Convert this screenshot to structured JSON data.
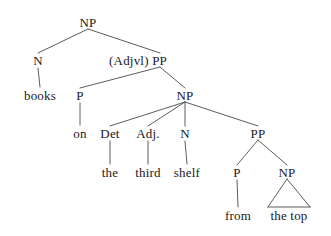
{
  "diagram": {
    "type": "syntax-tree",
    "title": "",
    "sentence": "books on the third shelf from the top",
    "background_color": "#ffffff",
    "line_color": "#4a4a4a",
    "text_color": "#1a1a1a"
  },
  "nodes": [
    {
      "id": "np-root",
      "label": "NP",
      "x": 88,
      "y": 22,
      "kind": "phrase"
    },
    {
      "id": "n-1",
      "label": "N",
      "x": 38,
      "y": 60,
      "kind": "category"
    },
    {
      "id": "pp-1",
      "label": "(Adjvl) PP",
      "x": 138,
      "y": 60,
      "kind": "phrase-optional"
    },
    {
      "id": "books",
      "label": "books",
      "x": 40,
      "y": 95,
      "kind": "terminal"
    },
    {
      "id": "p-1",
      "label": "P",
      "x": 80,
      "y": 95,
      "kind": "category"
    },
    {
      "id": "np-2",
      "label": "NP",
      "x": 185,
      "y": 95,
      "kind": "phrase"
    },
    {
      "id": "on",
      "label": "on",
      "x": 80,
      "y": 133,
      "kind": "terminal"
    },
    {
      "id": "det-1",
      "label": "Det",
      "x": 110,
      "y": 133,
      "kind": "category"
    },
    {
      "id": "adj-1",
      "label": "Adj.",
      "x": 148,
      "y": 133,
      "kind": "category"
    },
    {
      "id": "n-2",
      "label": "N",
      "x": 185,
      "y": 133,
      "kind": "category"
    },
    {
      "id": "pp-2",
      "label": "PP",
      "x": 258,
      "y": 133,
      "kind": "phrase"
    },
    {
      "id": "the",
      "label": "the",
      "x": 110,
      "y": 172,
      "kind": "terminal"
    },
    {
      "id": "third",
      "label": "third",
      "x": 148,
      "y": 172,
      "kind": "terminal"
    },
    {
      "id": "shelf",
      "label": "shelf",
      "x": 187,
      "y": 172,
      "kind": "terminal"
    },
    {
      "id": "p-2",
      "label": "P",
      "x": 237,
      "y": 172,
      "kind": "category"
    },
    {
      "id": "np-3",
      "label": "NP",
      "x": 287,
      "y": 172,
      "kind": "phrase"
    },
    {
      "id": "from",
      "label": "from",
      "x": 238,
      "y": 215,
      "kind": "terminal"
    },
    {
      "id": "the-top",
      "label": "the top",
      "x": 289,
      "y": 215,
      "kind": "terminal"
    }
  ],
  "edges": [
    {
      "from": "np-root",
      "to": "n-1",
      "style": "line"
    },
    {
      "from": "np-root",
      "to": "pp-1",
      "style": "line"
    },
    {
      "from": "n-1",
      "to": "books",
      "style": "stem"
    },
    {
      "from": "pp-1",
      "to": "p-1",
      "style": "line"
    },
    {
      "from": "pp-1",
      "to": "np-2",
      "style": "line"
    },
    {
      "from": "p-1",
      "to": "on",
      "style": "stem"
    },
    {
      "from": "np-2",
      "to": "det-1",
      "style": "line"
    },
    {
      "from": "np-2",
      "to": "adj-1",
      "style": "line"
    },
    {
      "from": "np-2",
      "to": "n-2",
      "style": "line"
    },
    {
      "from": "np-2",
      "to": "pp-2",
      "style": "line"
    },
    {
      "from": "det-1",
      "to": "the",
      "style": "stem"
    },
    {
      "from": "adj-1",
      "to": "third",
      "style": "stem"
    },
    {
      "from": "n-2",
      "to": "shelf",
      "style": "stem"
    },
    {
      "from": "pp-2",
      "to": "p-2",
      "style": "line"
    },
    {
      "from": "pp-2",
      "to": "np-3",
      "style": "line"
    },
    {
      "from": "p-2",
      "to": "from",
      "style": "stem"
    },
    {
      "from": "np-3",
      "to": "the-top",
      "style": "triangle"
    }
  ]
}
